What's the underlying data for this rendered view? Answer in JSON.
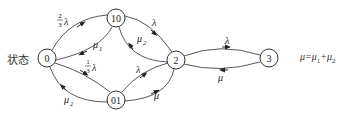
{
  "diagram": {
    "type": "state-transition",
    "left_label": "状态",
    "formula": {
      "lhs": "μ",
      "eq": "=",
      "term1": "μ",
      "term1_sub": "1",
      "plus": "+",
      "term2": "μ",
      "term2_sub": "2"
    },
    "nodes": [
      {
        "id": "0",
        "label": "0"
      },
      {
        "id": "10",
        "label": "10"
      },
      {
        "id": "01",
        "label": "01"
      },
      {
        "id": "2",
        "label": "2"
      },
      {
        "id": "3",
        "label": "3"
      }
    ],
    "edges": [
      {
        "from": "0",
        "to": "10",
        "rate": "2/3 λ",
        "num": "2",
        "den": "3",
        "sym": "λ"
      },
      {
        "from": "10",
        "to": "0",
        "rate": "μ1",
        "sym": "μ",
        "sub": "1"
      },
      {
        "from": "0",
        "to": "01",
        "rate": "1/3 λ",
        "num": "1",
        "den": "3",
        "sym": "λ"
      },
      {
        "from": "01",
        "to": "0",
        "rate": "μ2",
        "sym": "μ",
        "sub": "2"
      },
      {
        "from": "10",
        "to": "2",
        "rate": "λ",
        "sym": "λ"
      },
      {
        "from": "2",
        "to": "10",
        "rate": "μ2",
        "sym": "μ",
        "sub": "2"
      },
      {
        "from": "01",
        "to": "2",
        "rate": "λ",
        "sym": "λ"
      },
      {
        "from": "2",
        "to": "01",
        "rate": "μ",
        "sym": "μ"
      },
      {
        "from": "2",
        "to": "3",
        "rate": "λ",
        "sym": "λ"
      },
      {
        "from": "3",
        "to": "2",
        "rate": "μ",
        "sym": "μ"
      }
    ]
  }
}
